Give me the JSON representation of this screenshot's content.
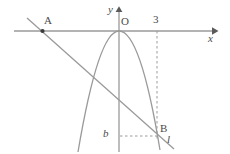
{
  "figure": {
    "type": "coordinate-plane-geometry-diagram",
    "background_color": "#ffffff",
    "stroke_color": "#8c8c8c",
    "label_color": "#4a4a4a",
    "axes": {
      "x_axis_label": "x",
      "y_axis_label": "y",
      "origin_label": "O",
      "x_axis_y_pixel": 31,
      "y_axis_x_pixel": 119
    },
    "tick_labels": [
      {
        "name": "x-tick-3",
        "text": "3",
        "axis": "x",
        "value": 3
      }
    ],
    "points": [
      {
        "name": "point-A",
        "label": "A",
        "x_pixel": 42,
        "y_pixel": 31,
        "on_axis": "x"
      },
      {
        "name": "point-B",
        "label": "B",
        "x_pixel": 157,
        "y_pixel": 136,
        "on_axis": "none"
      }
    ],
    "value_labels": [
      {
        "name": "b-value",
        "text": "b",
        "x_pixel": 107,
        "y_pixel": 135
      }
    ],
    "curves": [
      {
        "name": "parabola",
        "kind": "parabola",
        "opens": "down",
        "vertex_label": "O",
        "vertex_x_pixel": 119,
        "vertex_y_pixel": 31
      },
      {
        "name": "line-l",
        "kind": "line",
        "label": "l",
        "passes_through": [
          "A",
          "B"
        ],
        "x1_pixel": 27,
        "y1_pixel": 18,
        "x2_pixel": 174,
        "y2_pixel": 149
      }
    ],
    "guides": [
      {
        "name": "vertical-dashed-from-3",
        "style": "dashed",
        "orientation": "vertical",
        "from_label": "3",
        "to_label": "B"
      },
      {
        "name": "horizontal-dashed-from-b",
        "style": "dashed",
        "orientation": "horizontal",
        "from_label": "b",
        "to_label": "B"
      }
    ]
  }
}
